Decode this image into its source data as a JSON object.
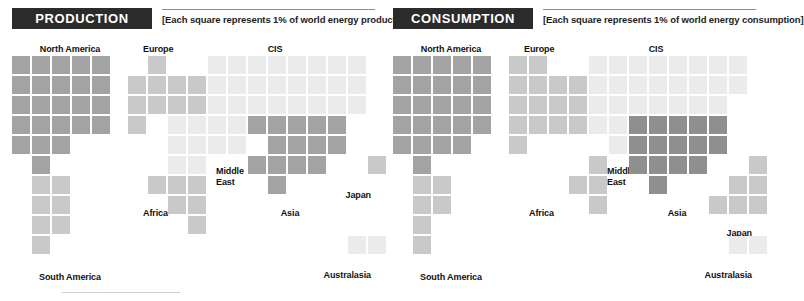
{
  "figure": {
    "square_unit_note": "Each square represents 1% of world energy",
    "grid": {
      "cell": 18,
      "pitch": 20
    },
    "palette": {
      "dark": "#8f8f8f",
      "mid": "#a3a3a3",
      "light": "#c9c9c9",
      "lighter": "#dcdcdc",
      "lightest": "#ebebeb"
    }
  },
  "panels": [
    {
      "id": "production",
      "title": "PRODUCTION",
      "caption": "[Each square represents 1% of world energy production]",
      "regions": [
        {
          "name": "North America",
          "label": {
            "text": "North America",
            "x": 70,
            "y": 44,
            "align": "center"
          },
          "shade": "mid",
          "cells": [
            [
              0,
              0
            ],
            [
              1,
              0
            ],
            [
              2,
              0
            ],
            [
              3,
              0
            ],
            [
              4,
              0
            ],
            [
              0,
              1
            ],
            [
              1,
              1
            ],
            [
              2,
              1
            ],
            [
              3,
              1
            ],
            [
              4,
              1
            ],
            [
              0,
              2
            ],
            [
              1,
              2
            ],
            [
              2,
              2
            ],
            [
              3,
              2
            ],
            [
              4,
              2
            ],
            [
              0,
              3
            ],
            [
              1,
              3
            ],
            [
              2,
              3
            ],
            [
              3,
              3
            ],
            [
              4,
              3
            ],
            [
              0,
              4
            ],
            [
              1,
              4
            ],
            [
              2,
              4
            ],
            [
              1,
              5
            ]
          ],
          "origin": [
            12,
            56
          ]
        },
        {
          "name": "South America",
          "label": {
            "text": "South America",
            "x": 70,
            "y": 272,
            "align": "center"
          },
          "shade": "light",
          "cells": [
            [
              1,
              6
            ],
            [
              2,
              6
            ],
            [
              1,
              7
            ],
            [
              2,
              7
            ],
            [
              1,
              8
            ],
            [
              2,
              8
            ],
            [
              1,
              9
            ]
          ],
          "origin": [
            12,
            56
          ]
        },
        {
          "name": "Europe",
          "label": {
            "text": "Europe",
            "x": 143,
            "y": 44,
            "align": "left"
          },
          "shade": "light",
          "cells": [
            [
              1,
              0
            ],
            [
              0,
              1
            ],
            [
              1,
              1
            ],
            [
              2,
              1
            ],
            [
              3,
              1
            ],
            [
              0,
              2
            ],
            [
              1,
              2
            ],
            [
              2,
              2
            ],
            [
              3,
              2
            ],
            [
              0,
              3
            ]
          ],
          "origin": [
            128,
            56
          ]
        },
        {
          "name": "CIS",
          "label": {
            "text": "CIS",
            "x": 275,
            "y": 44,
            "align": "center"
          },
          "shade": "lightest",
          "cells": [
            [
              4,
              0
            ],
            [
              5,
              0
            ],
            [
              6,
              0
            ],
            [
              7,
              0
            ],
            [
              8,
              0
            ],
            [
              9,
              0
            ],
            [
              10,
              0
            ],
            [
              11,
              0
            ],
            [
              4,
              1
            ],
            [
              5,
              1
            ],
            [
              6,
              1
            ],
            [
              7,
              1
            ],
            [
              8,
              1
            ],
            [
              9,
              1
            ],
            [
              10,
              1
            ],
            [
              11,
              1
            ],
            [
              4,
              2
            ],
            [
              5,
              2
            ],
            [
              6,
              2
            ],
            [
              7,
              2
            ],
            [
              8,
              2
            ],
            [
              9,
              2
            ],
            [
              10,
              2
            ],
            [
              11,
              2
            ]
          ],
          "origin": [
            128,
            56
          ]
        },
        {
          "name": "Middle East",
          "label": {
            "text": "Middle East",
            "x": 216,
            "y": 166,
            "align": "left",
            "lines": [
              "Middle",
              "East"
            ]
          },
          "shade": "lightest",
          "cells": [
            [
              2,
              3
            ],
            [
              3,
              3
            ],
            [
              4,
              3
            ],
            [
              5,
              3
            ],
            [
              2,
              4
            ],
            [
              3,
              4
            ],
            [
              4,
              4
            ],
            [
              5,
              4
            ],
            [
              2,
              5
            ],
            [
              3,
              5
            ]
          ],
          "origin": [
            128,
            56
          ]
        },
        {
          "name": "Africa",
          "label": {
            "text": "Africa",
            "x": 143,
            "y": 208,
            "align": "left"
          },
          "shade": "light",
          "cells": [
            [
              1,
              6
            ],
            [
              2,
              6
            ],
            [
              3,
              6
            ],
            [
              2,
              7
            ],
            [
              3,
              7
            ],
            [
              3,
              8
            ]
          ],
          "origin": [
            128,
            56
          ]
        },
        {
          "name": "Asia",
          "label": {
            "text": "Asia",
            "x": 290,
            "y": 208,
            "align": "center"
          },
          "shade": "mid",
          "cells": [
            [
              6,
              3
            ],
            [
              7,
              3
            ],
            [
              8,
              3
            ],
            [
              9,
              3
            ],
            [
              10,
              3
            ],
            [
              7,
              4
            ],
            [
              8,
              4
            ],
            [
              9,
              4
            ],
            [
              10,
              4
            ],
            [
              6,
              5
            ],
            [
              7,
              5
            ],
            [
              8,
              5
            ],
            [
              9,
              5
            ],
            [
              7,
              6
            ]
          ],
          "origin": [
            128,
            56
          ]
        },
        {
          "name": "Japan",
          "label": {
            "text": "Japan",
            "x": 371,
            "y": 190,
            "align": "right"
          },
          "shade": "light",
          "cells": [
            [
              12,
              5
            ]
          ],
          "origin": [
            128,
            56
          ]
        },
        {
          "name": "Australasia",
          "label": {
            "text": "Australasia",
            "x": 371,
            "y": 270,
            "align": "right"
          },
          "shade": "lightest",
          "cells": [
            [
              11,
              9
            ],
            [
              12,
              9
            ]
          ],
          "origin": [
            128,
            56
          ]
        }
      ]
    },
    {
      "id": "consumption",
      "title": "CONSUMPTION",
      "caption": "[Each square represents 1% of world energy consumption]",
      "regions": [
        {
          "name": "North America",
          "label": {
            "text": "North America",
            "x": 70,
            "y": 44,
            "align": "center"
          },
          "shade": "mid",
          "cells": [
            [
              0,
              0
            ],
            [
              1,
              0
            ],
            [
              2,
              0
            ],
            [
              3,
              0
            ],
            [
              4,
              0
            ],
            [
              0,
              1
            ],
            [
              1,
              1
            ],
            [
              2,
              1
            ],
            [
              3,
              1
            ],
            [
              4,
              1
            ],
            [
              0,
              2
            ],
            [
              1,
              2
            ],
            [
              2,
              2
            ],
            [
              3,
              2
            ],
            [
              4,
              2
            ],
            [
              0,
              3
            ],
            [
              1,
              3
            ],
            [
              2,
              3
            ],
            [
              3,
              3
            ],
            [
              4,
              3
            ],
            [
              0,
              4
            ],
            [
              1,
              4
            ],
            [
              2,
              4
            ],
            [
              3,
              4
            ],
            [
              1,
              5
            ]
          ],
          "origin": [
            12,
            56
          ]
        },
        {
          "name": "South America",
          "label": {
            "text": "South America",
            "x": 70,
            "y": 272,
            "align": "center"
          },
          "shade": "light",
          "cells": [
            [
              1,
              6
            ],
            [
              2,
              6
            ],
            [
              1,
              7
            ],
            [
              2,
              7
            ],
            [
              1,
              8
            ],
            [
              1,
              9
            ]
          ],
          "origin": [
            12,
            56
          ]
        },
        {
          "name": "Europe",
          "label": {
            "text": "Europe",
            "x": 143,
            "y": 44,
            "align": "left"
          },
          "shade": "light",
          "cells": [
            [
              0,
              0
            ],
            [
              1,
              0
            ],
            [
              0,
              1
            ],
            [
              1,
              1
            ],
            [
              2,
              1
            ],
            [
              3,
              1
            ],
            [
              0,
              2
            ],
            [
              1,
              2
            ],
            [
              2,
              2
            ],
            [
              3,
              2
            ],
            [
              0,
              3
            ],
            [
              1,
              3
            ],
            [
              2,
              3
            ],
            [
              3,
              3
            ],
            [
              0,
              4
            ]
          ],
          "origin": [
            128,
            56
          ]
        },
        {
          "name": "CIS",
          "label": {
            "text": "CIS",
            "x": 275,
            "y": 44,
            "align": "center"
          },
          "shade": "lightest",
          "cells": [
            [
              4,
              0
            ],
            [
              5,
              0
            ],
            [
              6,
              0
            ],
            [
              7,
              0
            ],
            [
              8,
              0
            ],
            [
              9,
              0
            ],
            [
              10,
              0
            ],
            [
              11,
              0
            ],
            [
              4,
              1
            ],
            [
              5,
              1
            ],
            [
              6,
              1
            ],
            [
              7,
              1
            ],
            [
              8,
              1
            ],
            [
              9,
              1
            ],
            [
              10,
              1
            ],
            [
              11,
              1
            ],
            [
              4,
              2
            ],
            [
              5,
              2
            ],
            [
              6,
              2
            ],
            [
              7,
              2
            ],
            [
              8,
              2
            ],
            [
              9,
              2
            ],
            [
              10,
              2
            ]
          ],
          "origin": [
            128,
            56
          ]
        },
        {
          "name": "Middle East",
          "label": {
            "text": "Middle East",
            "x": 226,
            "y": 166,
            "align": "left",
            "lines": [
              "Middle",
              "East"
            ]
          },
          "shade": "lightest",
          "cells": [
            [
              4,
              3
            ],
            [
              5,
              3
            ],
            [
              5,
              4
            ]
          ],
          "origin": [
            128,
            56
          ]
        },
        {
          "name": "Africa",
          "label": {
            "text": "Africa",
            "x": 148,
            "y": 208,
            "align": "left"
          },
          "shade": "light",
          "cells": [
            [
              4,
              5
            ],
            [
              3,
              6
            ],
            [
              4,
              6
            ],
            [
              4,
              7
            ]
          ],
          "origin": [
            128,
            56
          ]
        },
        {
          "name": "Asia",
          "label": {
            "text": "Asia",
            "x": 296,
            "y": 208,
            "align": "center"
          },
          "shade": "dark",
          "cells": [
            [
              6,
              3
            ],
            [
              7,
              3
            ],
            [
              8,
              3
            ],
            [
              9,
              3
            ],
            [
              10,
              3
            ],
            [
              6,
              4
            ],
            [
              7,
              4
            ],
            [
              8,
              4
            ],
            [
              9,
              4
            ],
            [
              10,
              4
            ],
            [
              6,
              5
            ],
            [
              7,
              5
            ],
            [
              8,
              5
            ],
            [
              9,
              5
            ],
            [
              7,
              6
            ]
          ],
          "origin": [
            128,
            56
          ]
        },
        {
          "name": "Japan",
          "label": {
            "text": "Japan",
            "x": 371,
            "y": 228,
            "align": "right"
          },
          "shade": "light",
          "cells": [
            [
              12,
              5
            ],
            [
              11,
              6
            ],
            [
              12,
              6
            ],
            [
              10,
              7
            ],
            [
              11,
              7
            ],
            [
              12,
              7
            ]
          ],
          "origin": [
            128,
            56
          ]
        },
        {
          "name": "Australasia",
          "label": {
            "text": "Australasia",
            "x": 371,
            "y": 270,
            "align": "right"
          },
          "shade": "lightest",
          "cells": [
            [
              11,
              9
            ],
            [
              12,
              9
            ]
          ],
          "origin": [
            128,
            56
          ]
        }
      ]
    }
  ],
  "chart_data": {
    "type": "waffle",
    "unit": "percent of world total",
    "unit_note": "Each square represents 1% of world energy",
    "panels": [
      {
        "name": "PRODUCTION",
        "categories": [
          "North America",
          "South America",
          "Europe",
          "CIS",
          "Middle East",
          "Africa",
          "Asia",
          "Japan",
          "Australasia"
        ],
        "values": [
          24,
          7,
          10,
          24,
          10,
          6,
          14,
          1,
          2
        ]
      },
      {
        "name": "CONSUMPTION",
        "categories": [
          "North America",
          "South America",
          "Europe",
          "CIS",
          "Middle East",
          "Africa",
          "Asia",
          "Japan",
          "Australasia"
        ],
        "values": [
          25,
          6,
          15,
          23,
          3,
          4,
          15,
          6,
          2
        ]
      }
    ],
    "legend": [],
    "grid": false
  }
}
